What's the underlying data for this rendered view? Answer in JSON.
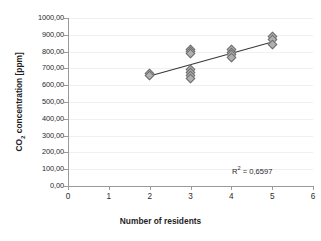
{
  "chart_data": {
    "type": "scatter",
    "title": "",
    "xlabel": "Number of residents",
    "ylabel_text": "CO",
    "ylabel_sub": "2",
    "ylabel_rest": " concentration  [ppm]",
    "xlim": [
      0,
      6
    ],
    "ylim": [
      0,
      1000
    ],
    "grid": true,
    "legend": "none",
    "decimal_separator": ",",
    "x_ticks": [
      "0",
      "1",
      "2",
      "3",
      "4",
      "5",
      "6"
    ],
    "x_tick_values": [
      0,
      1,
      2,
      3,
      4,
      5,
      6
    ],
    "y_ticks": [
      "0,00",
      "100,00",
      "200,00",
      "300,00",
      "400,00",
      "500,00",
      "600,00",
      "700,00",
      "800,00",
      "900,00",
      "1000,00"
    ],
    "y_tick_values": [
      0,
      100,
      200,
      300,
      400,
      500,
      600,
      700,
      800,
      900,
      1000
    ],
    "points": [
      {
        "x": 2,
        "y": 668
      },
      {
        "x": 2,
        "y": 655
      },
      {
        "x": 3,
        "y": 812
      },
      {
        "x": 3,
        "y": 800
      },
      {
        "x": 3,
        "y": 790
      },
      {
        "x": 3,
        "y": 692
      },
      {
        "x": 3,
        "y": 676
      },
      {
        "x": 3,
        "y": 660
      },
      {
        "x": 3,
        "y": 640
      },
      {
        "x": 4,
        "y": 810
      },
      {
        "x": 4,
        "y": 796
      },
      {
        "x": 4,
        "y": 783
      },
      {
        "x": 4,
        "y": 766
      },
      {
        "x": 5,
        "y": 890
      },
      {
        "x": 5,
        "y": 872
      },
      {
        "x": 5,
        "y": 842
      }
    ],
    "trendline": {
      "x_start": 2,
      "y_start": 655,
      "x_end": 5,
      "y_end": 857,
      "color": "#3a3a3a"
    },
    "annotation": {
      "r2_prefix": "R",
      "r2_sup": "2",
      "r2_value": " = 0,6597"
    },
    "colors": {
      "marker_fill": "#b0b0b0",
      "marker_edge": "#6e6e6e",
      "axis": "#9a9a9a",
      "grid": "#f0f0f0",
      "text": "#1f1f1f",
      "background": "#ffffff"
    }
  }
}
